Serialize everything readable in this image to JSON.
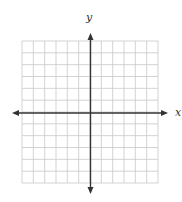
{
  "diagram": {
    "type": "coordinate-plane",
    "x_axis_label": "x",
    "y_axis_label": "y",
    "grid": {
      "columns": 12,
      "rows": 12,
      "left": 22,
      "top": 41,
      "right": 158,
      "bottom": 183,
      "line_color": "#c8c8c8",
      "line_width": 0.8
    },
    "axes": {
      "origin_x": 90.5,
      "origin_y": 113,
      "x_arrow_left": 12,
      "x_arrow_right": 168,
      "y_arrow_top": 33,
      "y_arrow_bottom": 194,
      "color": "#333333",
      "width": 1.4
    },
    "labels": {
      "x": {
        "text": "x",
        "x": 175,
        "y": 116
      },
      "y": {
        "text": "y",
        "x": 86,
        "y": 21
      }
    }
  }
}
